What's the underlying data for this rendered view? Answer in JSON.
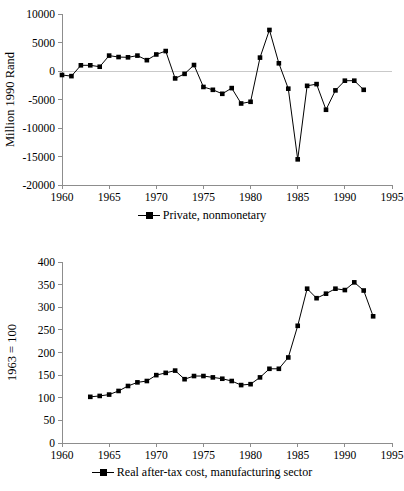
{
  "chart_data": [
    {
      "id": "top",
      "type": "line",
      "title": "",
      "xlabel": "",
      "ylabel": "Million 1990 Rand",
      "xlim": [
        1960,
        1995
      ],
      "ylim": [
        -20000,
        10000
      ],
      "yticks": [
        10000,
        5000,
        0,
        -5000,
        -10000,
        -15000,
        -20000
      ],
      "ytick_labels": [
        "10000",
        "5000",
        "0",
        "-5000",
        "-10000",
        "-15000",
        "-20000"
      ],
      "xticks": [
        1960,
        1965,
        1970,
        1975,
        1980,
        1985,
        1990,
        1995
      ],
      "xtick_labels": [
        "1960",
        "1965",
        "1970",
        "1975",
        "1980",
        "1985",
        "1990",
        "1995"
      ],
      "grid": false,
      "legend_position": "bottom-center",
      "marker": "square",
      "series": [
        {
          "name": "Private, nonmonetary",
          "color": "#000000",
          "x": [
            1960,
            1961,
            1962,
            1963,
            1964,
            1965,
            1966,
            1967,
            1968,
            1969,
            1970,
            1971,
            1972,
            1973,
            1974,
            1975,
            1976,
            1977,
            1978,
            1979,
            1980,
            1981,
            1982,
            1983,
            1984,
            1985,
            1986,
            1987,
            1988,
            1989,
            1990,
            1991,
            1992
          ],
          "values": [
            -700,
            -900,
            1000,
            1000,
            750,
            2700,
            2450,
            2400,
            2700,
            1900,
            2900,
            3500,
            -1300,
            -500,
            1050,
            -2800,
            -3300,
            -4000,
            -3000,
            -5700,
            -5400,
            2350,
            7200,
            1350,
            -3100,
            -15500,
            -2600,
            -2300,
            -6800,
            -3400,
            -1700,
            -1700,
            -3300
          ]
        }
      ]
    },
    {
      "id": "bottom",
      "type": "line",
      "title": "",
      "xlabel": "",
      "ylabel": "1963 = 100",
      "xlim": [
        1960,
        1995
      ],
      "ylim": [
        0,
        400
      ],
      "yticks": [
        400,
        350,
        300,
        250,
        200,
        150,
        100,
        50,
        0
      ],
      "ytick_labels": [
        "400",
        "350",
        "300",
        "250",
        "200",
        "150",
        "100",
        "50",
        "0"
      ],
      "xticks": [
        1960,
        1965,
        1970,
        1975,
        1980,
        1985,
        1990,
        1995
      ],
      "xtick_labels": [
        "1960",
        "1965",
        "1970",
        "1975",
        "1980",
        "1985",
        "1990",
        "1995"
      ],
      "grid": false,
      "legend_position": "bottom-center",
      "marker": "square",
      "series": [
        {
          "name": "Real after-tax cost, manufacturing sector",
          "color": "#000000",
          "x": [
            1963,
            1964,
            1965,
            1966,
            1967,
            1968,
            1969,
            1970,
            1971,
            1972,
            1973,
            1974,
            1975,
            1976,
            1977,
            1978,
            1979,
            1980,
            1981,
            1982,
            1983,
            1984,
            1985,
            1986,
            1987,
            1988,
            1989,
            1990,
            1991,
            1992,
            1993
          ],
          "values": [
            102,
            104,
            107,
            115,
            126,
            134,
            137,
            150,
            155,
            160,
            141,
            148,
            148,
            145,
            142,
            137,
            128,
            130,
            145,
            164,
            164,
            189,
            259,
            341,
            320,
            330,
            341,
            338,
            355,
            337,
            280
          ]
        }
      ]
    }
  ],
  "figures": {
    "top": {
      "ylabel": "Million 1990 Rand",
      "legend_label": "Private, nonmonetary"
    },
    "bottom": {
      "ylabel": "1963 = 100",
      "legend_label": "Real after-tax cost, manufacturing sector"
    }
  }
}
